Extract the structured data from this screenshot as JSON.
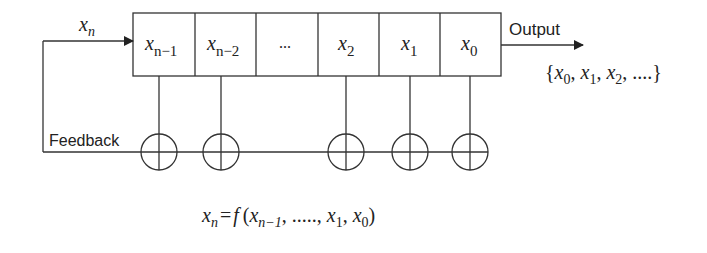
{
  "diagram": {
    "type": "shift-register-with-feedback",
    "input_label": {
      "var": "x",
      "sub": "n"
    },
    "cells": [
      {
        "var": "x",
        "sub": "n−1"
      },
      {
        "var": "x",
        "sub": "n−2"
      },
      {
        "var": "",
        "sub": "",
        "text": "..."
      },
      {
        "var": "x",
        "sub": "2"
      },
      {
        "var": "x",
        "sub": "1"
      },
      {
        "var": "x",
        "sub": "0"
      }
    ],
    "output_label": "Output",
    "output_sequence": {
      "open": "{",
      "items": [
        {
          "var": "x",
          "sub": "0"
        },
        {
          "var": "x",
          "sub": "1"
        },
        {
          "var": "x",
          "sub": "2"
        }
      ],
      "tail": ", ....}"
    },
    "feedback_label": "Feedback",
    "xor_count": 5,
    "equation": {
      "lhs_var": "x",
      "lhs_sub": "n",
      "eq": "=",
      "func": "f",
      "open": "(",
      "arg1_var": "x",
      "arg1_sub": "n−1",
      "dots": ", ....., ",
      "arg2_var": "x",
      "arg2_sub": "1",
      "sep": ", ",
      "arg3_var": "x",
      "arg3_sub": "0",
      "close": ")"
    }
  }
}
